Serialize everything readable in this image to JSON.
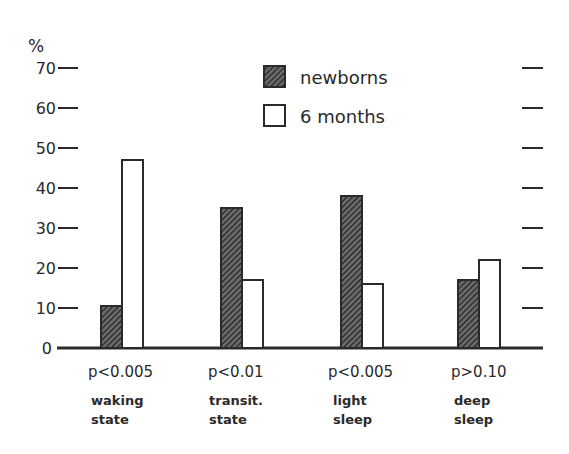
{
  "chart_data": {
    "type": "bar",
    "title": "",
    "xlabel": "",
    "ylabel": "%",
    "ylim": [
      0,
      70
    ],
    "yticks": [
      0,
      10,
      20,
      30,
      40,
      50,
      60,
      70
    ],
    "grid": false,
    "legend_position": "top-center",
    "categories": [
      "waking state",
      "transit. state",
      "light sleep",
      "deep sleep"
    ],
    "category_lines": [
      [
        "waking",
        "state"
      ],
      [
        "transit.",
        "state"
      ],
      [
        "light",
        "sleep"
      ],
      [
        "deep",
        "sleep"
      ]
    ],
    "annotations": [
      "p<0.005",
      "p<0.01",
      "p<0.005",
      "p>0.10"
    ],
    "series": [
      {
        "name": "newborns",
        "pattern": "hatched",
        "values": [
          10.5,
          35,
          38,
          17
        ]
      },
      {
        "name": "6 months",
        "pattern": "open",
        "values": [
          47,
          17,
          16,
          22
        ]
      }
    ]
  },
  "colors": {
    "ink": "#2a2a2a",
    "background": "#ffffff"
  }
}
